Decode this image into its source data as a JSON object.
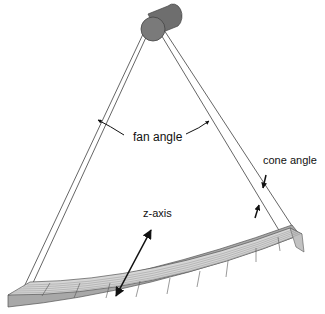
{
  "diagram": {
    "type": "CT scanner fan-beam / cone-beam geometry",
    "labels": {
      "fan_angle": "fan angle",
      "cone_angle": "cone angle",
      "z_axis": "z-axis"
    },
    "components": {
      "source": "x-ray tube",
      "detector": "curved multi-row detector array"
    },
    "colors": {
      "source_fill": "#707070",
      "detector_top": "#d9d9d9",
      "detector_front": "#a8a8a8",
      "lines": "#444444",
      "background": "#ffffff"
    }
  }
}
